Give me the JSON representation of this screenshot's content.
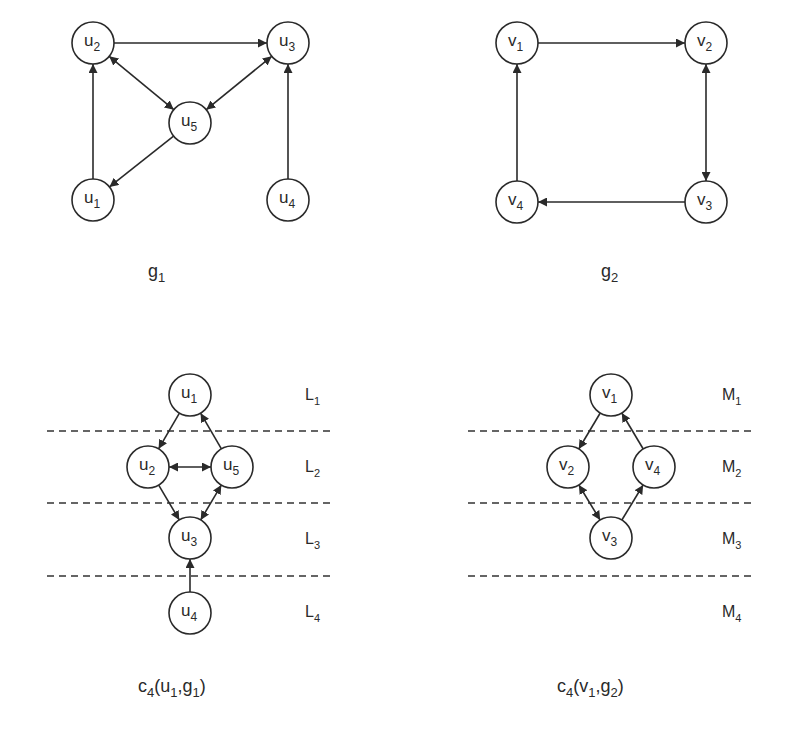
{
  "figure": {
    "panels": [
      {
        "id": "g1",
        "caption": {
          "base": "g",
          "sub": "1",
          "full": "g1",
          "x": 148,
          "y": 277
        },
        "node_radius": 21,
        "nodes": [
          {
            "id": "u1",
            "base": "u",
            "sub": "1",
            "x": 93,
            "y": 200
          },
          {
            "id": "u2",
            "base": "u",
            "sub": "2",
            "x": 93,
            "y": 43
          },
          {
            "id": "u3",
            "base": "u",
            "sub": "3",
            "x": 288,
            "y": 43
          },
          {
            "id": "u4",
            "base": "u",
            "sub": "4",
            "x": 288,
            "y": 200
          },
          {
            "id": "u5",
            "base": "u",
            "sub": "5",
            "x": 190,
            "y": 123
          }
        ],
        "edges": [
          {
            "from": "u2",
            "to": "u3",
            "type": "directed"
          },
          {
            "from": "u1",
            "to": "u2",
            "type": "directed"
          },
          {
            "from": "u2",
            "to": "u5",
            "type": "bidirectional"
          },
          {
            "from": "u3",
            "to": "u5",
            "type": "bidirectional"
          },
          {
            "from": "u5",
            "to": "u1",
            "type": "directed"
          },
          {
            "from": "u4",
            "to": "u3",
            "type": "directed"
          }
        ]
      },
      {
        "id": "g2",
        "caption": {
          "base": "g",
          "sub": "2",
          "full": "g2",
          "x": 601,
          "y": 277
        },
        "node_radius": 21,
        "nodes": [
          {
            "id": "v1",
            "base": "v",
            "sub": "1",
            "x": 517,
            "y": 43
          },
          {
            "id": "v2",
            "base": "v",
            "sub": "2",
            "x": 706,
            "y": 43
          },
          {
            "id": "v3",
            "base": "v",
            "sub": "3",
            "x": 706,
            "y": 202
          },
          {
            "id": "v4",
            "base": "v",
            "sub": "4",
            "x": 517,
            "y": 202
          }
        ],
        "edges": [
          {
            "from": "v1",
            "to": "v2",
            "type": "directed"
          },
          {
            "from": "v2",
            "to": "v3",
            "type": "bidirectional"
          },
          {
            "from": "v3",
            "to": "v4",
            "type": "directed"
          },
          {
            "from": "v4",
            "to": "v1",
            "type": "directed"
          }
        ]
      },
      {
        "id": "c4_u1_g1",
        "caption": {
          "base": "c",
          "sub": "4",
          "args": "(u1,g1)",
          "full": "c4(u1,g1)",
          "parts": [
            [
              "c",
              ""
            ],
            [
              "",
              "4"
            ],
            [
              "(u",
              ""
            ],
            [
              "",
              "1"
            ],
            [
              ",g",
              ""
            ],
            [
              "",
              "1"
            ],
            [
              ")",
              ""
            ]
          ],
          "x": 138,
          "y": 692
        },
        "node_radius": 21,
        "nodes": [
          {
            "id": "u1",
            "base": "u",
            "sub": "1",
            "x": 190,
            "y": 395
          },
          {
            "id": "u2",
            "base": "u",
            "sub": "2",
            "x": 148,
            "y": 467
          },
          {
            "id": "u5",
            "base": "u",
            "sub": "5",
            "x": 232,
            "y": 467
          },
          {
            "id": "u3",
            "base": "u",
            "sub": "3",
            "x": 190,
            "y": 538
          },
          {
            "id": "u4",
            "base": "u",
            "sub": "4",
            "x": 190,
            "y": 613
          }
        ],
        "edges": [
          {
            "from": "u1",
            "to": "u2",
            "type": "directed"
          },
          {
            "from": "u5",
            "to": "u1",
            "type": "directed"
          },
          {
            "from": "u2",
            "to": "u5",
            "type": "bidirectional"
          },
          {
            "from": "u2",
            "to": "u3",
            "type": "directed"
          },
          {
            "from": "u5",
            "to": "u3",
            "type": "bidirectional"
          },
          {
            "from": "u4",
            "to": "u3",
            "type": "directed"
          }
        ],
        "level_lines": {
          "x1": 47,
          "x2": 334,
          "ys": [
            431,
            503,
            576
          ]
        },
        "levels": [
          {
            "base": "L",
            "sub": "1",
            "x": 305,
            "y": 400
          },
          {
            "base": "L",
            "sub": "2",
            "x": 305,
            "y": 472
          },
          {
            "base": "L",
            "sub": "3",
            "x": 305,
            "y": 544
          },
          {
            "base": "L",
            "sub": "4",
            "x": 305,
            "y": 617
          }
        ]
      },
      {
        "id": "c4_v1_g2",
        "caption": {
          "base": "c",
          "sub": "4",
          "args": "(v1,g2)",
          "full": "c4(v1,g2)",
          "parts": [
            [
              "c",
              ""
            ],
            [
              "",
              "4"
            ],
            [
              "(v",
              ""
            ],
            [
              "",
              "1"
            ],
            [
              ",g",
              ""
            ],
            [
              "",
              "2"
            ],
            [
              ")",
              ""
            ]
          ],
          "x": 557,
          "y": 692
        },
        "node_radius": 21,
        "nodes": [
          {
            "id": "v1",
            "base": "v",
            "sub": "1",
            "x": 611,
            "y": 395
          },
          {
            "id": "v2",
            "base": "v",
            "sub": "2",
            "x": 568,
            "y": 467
          },
          {
            "id": "v4",
            "base": "v",
            "sub": "4",
            "x": 654,
            "y": 467
          },
          {
            "id": "v3",
            "base": "v",
            "sub": "3",
            "x": 611,
            "y": 538
          }
        ],
        "edges": [
          {
            "from": "v1",
            "to": "v2",
            "type": "directed"
          },
          {
            "from": "v4",
            "to": "v1",
            "type": "directed"
          },
          {
            "from": "v2",
            "to": "v3",
            "type": "bidirectional"
          },
          {
            "from": "v3",
            "to": "v4",
            "type": "directed"
          }
        ],
        "level_lines": {
          "x1": 468,
          "x2": 752,
          "ys": [
            431,
            503,
            576
          ]
        },
        "levels": [
          {
            "base": "M",
            "sub": "1",
            "x": 722,
            "y": 400
          },
          {
            "base": "M",
            "sub": "2",
            "x": 722,
            "y": 472
          },
          {
            "base": "M",
            "sub": "3",
            "x": 722,
            "y": 544
          },
          {
            "base": "M",
            "sub": "4",
            "x": 722,
            "y": 617
          }
        ]
      }
    ]
  },
  "colors": {
    "ink": "#2a2a2a",
    "background": "#ffffff"
  }
}
